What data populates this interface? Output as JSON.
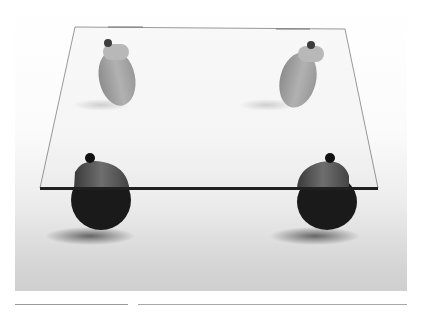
{
  "image": {
    "subject": "glass coffee table on four caster wheels",
    "description": "Square clear glass tabletop resting on four pivoting casters, photographed on a white-to-gray gradient studio floor",
    "colors": {
      "background": "#ffffff",
      "floor_top": "#ffffff",
      "floor_bottom": "#cfcfcf",
      "glass_edge": "#2a2a2a",
      "caster_near": "#1c1c1c",
      "caster_far": "#8e8e8e"
    }
  },
  "rules": [
    {
      "position": "left",
      "color": "#9a9a9a"
    },
    {
      "position": "right",
      "color": "#a8a8a8"
    }
  ]
}
